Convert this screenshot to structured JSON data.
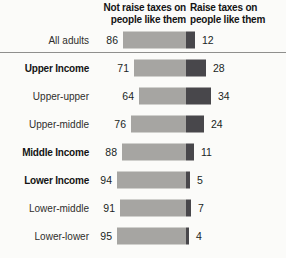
{
  "chart_data": {
    "type": "bar",
    "orientation": "horizontal",
    "variant": "diverging-stacked",
    "col_headers": {
      "left": "Not raise taxes on people like them",
      "left_lines": [
        "Not raise taxes on",
        "people like them"
      ],
      "right": "Raise taxes on people like them",
      "right_lines": [
        "Raise taxes on",
        "people like them"
      ]
    },
    "categories": [
      "All adults",
      "Upper Income",
      "Upper-upper",
      "Upper-middle",
      "Middle Income",
      "Lower Income",
      "Lower-middle",
      "Lower-lower"
    ],
    "series": [
      {
        "name": "Not raise taxes on people like them",
        "values": [
          86,
          71,
          64,
          76,
          88,
          94,
          91,
          95
        ],
        "color": "#a6a5a2"
      },
      {
        "name": "Raise taxes on people like them",
        "values": [
          12,
          28,
          34,
          24,
          11,
          5,
          7,
          4
        ],
        "color": "#48474b"
      }
    ],
    "bold_categories": [
      "Upper Income",
      "Middle Income",
      "Lower Income"
    ],
    "separator_after_category": "All adults",
    "value_range": [
      0,
      100
    ],
    "grid": false,
    "colors": {
      "background": "#fbfbf9",
      "separator_line": "#8f8f8d",
      "label_text": "#2f2e2c",
      "value_text": "#201f1e",
      "header_text": "#141414"
    },
    "layout": {
      "divider_x": 186,
      "px_per_point": 0.73,
      "first_row_center_y": 40,
      "row_pitch": 28,
      "bar_height": 17
    }
  }
}
